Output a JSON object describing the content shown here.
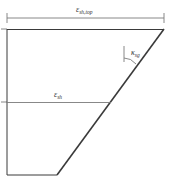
{
  "diagram": {
    "type": "strain profile",
    "labels": {
      "top_strain": {
        "symbol": "ε",
        "subscript": "sh,top"
      },
      "mid_strain": {
        "symbol": "ε",
        "subscript": "sh"
      },
      "curvature": {
        "symbol": "κ",
        "subscript": "sg"
      }
    },
    "colors": {
      "line": "#3a3a3a",
      "dimension": "#7a7a7a",
      "background": "#ffffff"
    }
  }
}
